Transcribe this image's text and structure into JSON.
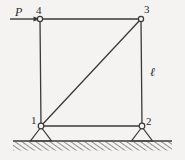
{
  "figure": {
    "background_color": "#f4f3f1",
    "line_color": "#3a3a3a",
    "width": 185,
    "height": 160
  },
  "labels": {
    "load": "P",
    "length": "ℓ",
    "node_4": "4",
    "node_3": "3",
    "node_1": "1",
    "node_2": "2"
  },
  "structure": {
    "nodes": [
      {
        "id": "4",
        "x": 40,
        "y": 19,
        "type": "pin-joint"
      },
      {
        "id": "3",
        "x": 141,
        "y": 19,
        "type": "pin-joint"
      },
      {
        "id": "1",
        "x": 41,
        "y": 126,
        "type": "pin-support"
      },
      {
        "id": "2",
        "x": 142,
        "y": 126,
        "type": "pin-support"
      }
    ],
    "members": [
      {
        "name": "top-chord",
        "from": "4",
        "to": "3"
      },
      {
        "name": "left-column",
        "from": "4",
        "to": "1"
      },
      {
        "name": "right-column",
        "from": "3",
        "to": "2"
      },
      {
        "name": "bottom-chord",
        "from": "1",
        "to": "2"
      },
      {
        "name": "diagonal-brace",
        "from": "1",
        "to": "3"
      }
    ],
    "load": {
      "name": "horizontal-point-load",
      "symbol": "P",
      "applied_at": "4",
      "direction": "right",
      "tail_x": 10,
      "tip_x": 40,
      "y": 19
    },
    "dimension": {
      "name": "column-height",
      "symbol": "ℓ",
      "measures": "right-column"
    },
    "ground": {
      "line_y": 141,
      "x_start": 13,
      "x_end": 172,
      "hatching": "diagonal"
    }
  }
}
